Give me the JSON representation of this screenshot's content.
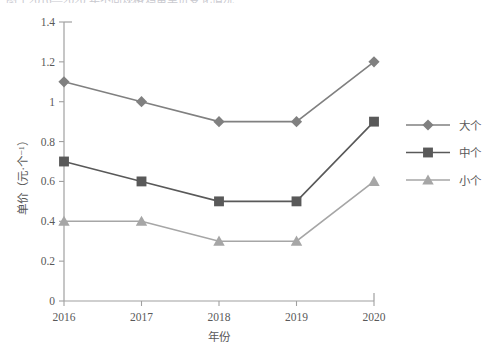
{
  "figure": {
    "caption_sliver": "图 1 2016—2020 年不同规格鸡蛋单价变化情况",
    "background": "#ffffff"
  },
  "chart_data": {
    "type": "line",
    "title": "",
    "xlabel": "年份",
    "ylabel": "单价（元·个⁻¹）",
    "categories": [
      "2016",
      "2017",
      "2018",
      "2019",
      "2020"
    ],
    "ylim": [
      0,
      1.4
    ],
    "ytick_labels": [
      "0",
      "0.2",
      "0.4",
      "0.6",
      "0.8",
      "1",
      "1.2",
      "1.4"
    ],
    "ytick_values": [
      0,
      0.2,
      0.4,
      0.6,
      0.8,
      1.0,
      1.2,
      1.4
    ],
    "grid": false,
    "legend_position": "right",
    "series": [
      {
        "name": "大个",
        "values": [
          1.1,
          1.0,
          0.9,
          0.9,
          1.2
        ],
        "color": "#808080",
        "marker": "diamond"
      },
      {
        "name": "中个",
        "values": [
          0.7,
          0.6,
          0.5,
          0.5,
          0.9
        ],
        "color": "#595959",
        "marker": "square"
      },
      {
        "name": "小个",
        "values": [
          0.4,
          0.4,
          0.3,
          0.3,
          0.6
        ],
        "color": "#a6a6a6",
        "marker": "triangle"
      }
    ]
  }
}
